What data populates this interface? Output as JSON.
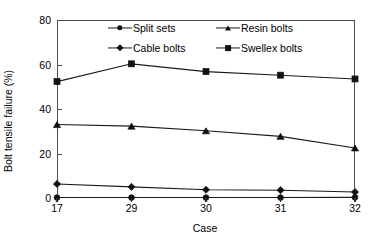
{
  "chart_data": {
    "type": "line",
    "title": "",
    "subtitle": "",
    "xlabel": "Case",
    "ylabel": "Bolt tensile failure (%)",
    "categories": [
      "17",
      "29",
      "30",
      "31",
      "32"
    ],
    "ylim": [
      0,
      80
    ],
    "yticks": [
      0,
      20,
      40,
      60,
      80
    ],
    "grid": false,
    "legend_position": "top-inside",
    "series": [
      {
        "name": "Split sets",
        "marker": "circle",
        "values": [
          0.2,
          0.2,
          0.2,
          0.2,
          0.3
        ]
      },
      {
        "name": "Resin bolts",
        "marker": "triangle",
        "values": [
          33.0,
          32.3,
          30.2,
          27.7,
          22.5
        ]
      },
      {
        "name": "Cable bolts",
        "marker": "diamond",
        "values": [
          6.3,
          5.0,
          3.7,
          3.5,
          2.7
        ]
      },
      {
        "name": "Swellex bolts",
        "marker": "square",
        "values": [
          52.3,
          60.3,
          56.8,
          55.2,
          53.5
        ]
      }
    ],
    "colors": {
      "series_line": "#1a1a1a",
      "marker_fill": "#111111",
      "axis": "#4d4d4d",
      "background": "#ffffff",
      "text": "#000000"
    }
  },
  "legend": {
    "entries": [
      {
        "label": "Split sets",
        "marker": "circle"
      },
      {
        "label": "Resin bolts",
        "marker": "triangle"
      },
      {
        "label": "Cable bolts",
        "marker": "diamond"
      },
      {
        "label": "Swellex bolts",
        "marker": "square"
      }
    ]
  },
  "axes": {
    "y_tick_labels": [
      "80",
      "60",
      "40",
      "20",
      "0"
    ],
    "x_tick_labels": [
      "17",
      "29",
      "30",
      "31",
      "32"
    ],
    "y_title": "Bolt tensile failure (%)",
    "x_title": "Case"
  }
}
